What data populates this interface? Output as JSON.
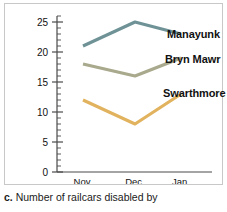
{
  "caption": {
    "letter": "c.",
    "text": "Number of railcars disabled by"
  },
  "colors": {
    "manayunk": "#6f9296",
    "bryn_mawr": "#a9a98d",
    "swarthmore": "#e2b35e",
    "axis": "#4a4a4a",
    "frame": "#c8c8c8",
    "text": "#111111"
  },
  "series_labels": {
    "manayunk": "Manayunk",
    "bryn_mawr": "Bryn Mawr",
    "swarthmore": "Swarthmore"
  },
  "chart_data": {
    "type": "line",
    "title": "",
    "xlabel": "",
    "ylabel": "",
    "categories": [
      "Nov.",
      "Dec.",
      "Jan."
    ],
    "ytick_labels": [
      "0",
      "5",
      "10",
      "15",
      "20",
      "25"
    ],
    "yticks": [
      0,
      5,
      10,
      15,
      20,
      25
    ],
    "ylim": [
      0,
      26
    ],
    "minor_tick_step": 1,
    "grid": false,
    "legend_position": "right-inline-labels",
    "series": [
      {
        "name": "Manayunk",
        "values": [
          21,
          25,
          23
        ],
        "color": "#6f9296"
      },
      {
        "name": "Bryn Mawr",
        "values": [
          18,
          16,
          19
        ],
        "color": "#a9a98d"
      },
      {
        "name": "Swarthmore",
        "values": [
          12,
          8,
          13
        ],
        "color": "#e2b35e"
      }
    ]
  }
}
